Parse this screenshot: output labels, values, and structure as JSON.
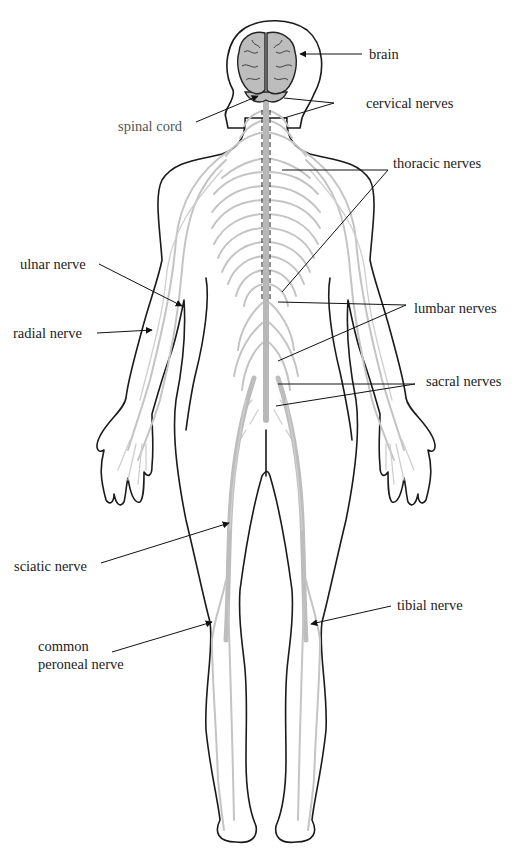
{
  "labels": {
    "brain": "brain",
    "cervical_nerves": "cervical nerves",
    "spinal_cord": "spinal cord",
    "thoracic_nerves": "thoracic nerves",
    "ulnar_nerve": "ulnar nerve",
    "radial_nerve": "radial nerve",
    "lumbar_nerves": "lumbar nerves",
    "sacral_nerves": "sacral nerves",
    "sciatic_nerve": "sciatic nerve",
    "tibial_nerve": "tibial nerve",
    "common_peroneal_nerve_line1": "common",
    "common_peroneal_nerve_line2": "peroneal nerve"
  },
  "colors": {
    "outline": "#1a1a1a",
    "nerve": "#c4c4c4",
    "brain": "#bdbdbd",
    "background": "#ffffff"
  }
}
